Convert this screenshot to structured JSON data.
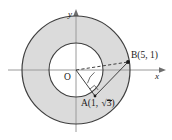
{
  "figure": {
    "background_color": "#ffffff",
    "ring_fill_color": "#d9d9d9",
    "inner_fill_color": "#ffffff",
    "stroke_color": "#3a3a3a",
    "axis_color": "#8a8a8a",
    "text_color": "#1a1a1a"
  },
  "axes": {
    "x_label": "x",
    "y_label": "y",
    "origin_label": "O"
  },
  "points": {
    "A": {
      "label_prefix": "A(1, ",
      "label_radical": "3",
      "label_suffix": ")",
      "full_label": "A(1, √3)",
      "x": 1,
      "y": -1.732
    },
    "B": {
      "label": "B(5, 1)",
      "x": 5,
      "y": 1
    }
  },
  "segments": {
    "OA": "solid",
    "OB": "dashed",
    "AB": "solid"
  },
  "markers": {
    "right_angle_at_A": true,
    "angle_arc_at_O": true
  },
  "circles": {
    "inner_radius": 2,
    "outer_radius": 4
  }
}
